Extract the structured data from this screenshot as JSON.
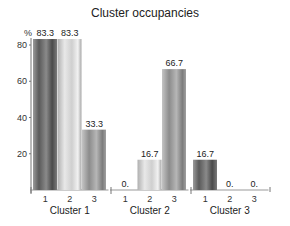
{
  "chart_data": {
    "type": "bar",
    "title": "Cluster occupancies",
    "ylabel": "%",
    "xlabel": "",
    "ylim": [
      0,
      83.3
    ],
    "yticks": [
      20,
      40,
      60,
      80
    ],
    "grid": false,
    "groups": [
      "Cluster 1",
      "Cluster 2",
      "Cluster 3"
    ],
    "categories": [
      "1",
      "2",
      "3"
    ],
    "series": [
      {
        "name": "Cluster 1",
        "values": [
          83.3,
          83.3,
          33.3
        ],
        "labels": [
          "83.3",
          "83.3",
          "33.3"
        ]
      },
      {
        "name": "Cluster 2",
        "values": [
          0,
          16.7,
          66.7
        ],
        "labels": [
          "0.",
          "16.7",
          "66.7"
        ]
      },
      {
        "name": "Cluster 3",
        "values": [
          16.7,
          0,
          0
        ],
        "labels": [
          "16.7",
          "0.",
          "0."
        ]
      }
    ],
    "bar_colors": [
      "#6e6e6e",
      "#d4d4d4",
      "#9a9a9a"
    ]
  }
}
